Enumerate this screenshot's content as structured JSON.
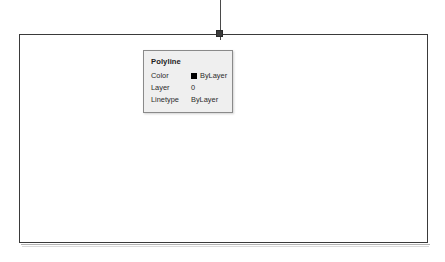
{
  "canvas": {
    "background_color": "#ffffff",
    "entity_color": "#3a3a3a",
    "grip_color": "#3b3b3b"
  },
  "drawing": {
    "polyline_rectangle_name": "polyline-rectangle",
    "leader_line_name": "leader-line",
    "grip_name": "selection-grip"
  },
  "tooltip": {
    "title": "Polyline",
    "background_color": "#efefef",
    "border_color": "#8a8a8a",
    "rows": [
      {
        "label": "Color",
        "value": "ByLayer",
        "swatch": "#000000"
      },
      {
        "label": "Layer",
        "value": "0",
        "swatch": null
      },
      {
        "label": "Linetype",
        "value": "ByLayer",
        "swatch": null
      }
    ]
  }
}
